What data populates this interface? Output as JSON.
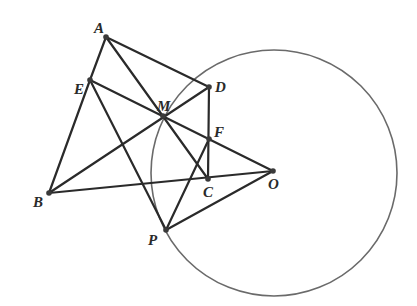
{
  "diagram": {
    "type": "geometry",
    "points": {
      "A": {
        "label": "A",
        "x": 106,
        "y": 37,
        "lx": 94,
        "ly": 33
      },
      "E": {
        "label": "E",
        "x": 90,
        "y": 80,
        "lx": 74,
        "ly": 94
      },
      "D": {
        "label": "D",
        "x": 209,
        "y": 87,
        "lx": 215,
        "ly": 92
      },
      "M": {
        "label": "M",
        "x": 163,
        "y": 116,
        "lx": 157,
        "ly": 111
      },
      "F": {
        "label": "F",
        "x": 209,
        "y": 139,
        "lx": 214,
        "ly": 137
      },
      "C": {
        "label": "C",
        "x": 208,
        "y": 179,
        "lx": 203,
        "ly": 197
      },
      "O": {
        "label": "O",
        "x": 273,
        "y": 171,
        "lx": 268,
        "ly": 189
      },
      "B": {
        "label": "B",
        "x": 49,
        "y": 193,
        "lx": 33,
        "ly": 207
      },
      "P": {
        "label": "P",
        "x": 166,
        "y": 230,
        "lx": 148,
        "ly": 245
      }
    },
    "circle": {
      "center": "O",
      "cx": 274,
      "cy": 173,
      "r": 123
    },
    "segments": [
      [
        "A",
        "E"
      ],
      [
        "A",
        "D"
      ],
      [
        "A",
        "C"
      ],
      [
        "E",
        "B"
      ],
      [
        "E",
        "O"
      ],
      [
        "E",
        "P"
      ],
      [
        "B",
        "D"
      ],
      [
        "B",
        "O"
      ],
      [
        "D",
        "C"
      ],
      [
        "P",
        "F"
      ],
      [
        "P",
        "O"
      ]
    ]
  }
}
